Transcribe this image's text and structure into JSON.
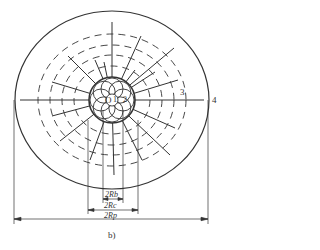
{
  "figure": {
    "caption": "b)",
    "labels": {
      "center": "O",
      "inner_ring": "1",
      "core": "2",
      "dashed_zone": "3",
      "outer_boundary": "4"
    },
    "dimensions": {
      "rb": "2Rb",
      "rc": "2Rc",
      "rp": "2Rp"
    }
  },
  "colors": {
    "stroke": "#333333",
    "background": "#ffffff"
  }
}
